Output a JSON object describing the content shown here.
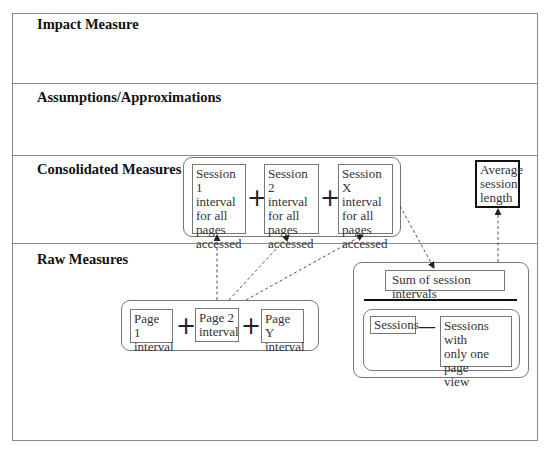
{
  "sections": [
    {
      "title": "Impact Measure"
    },
    {
      "title": "Assumptions/Approximations"
    },
    {
      "title": "Consolidated Measures"
    },
    {
      "title": "Raw Measures"
    }
  ],
  "consolidated": {
    "sessions": [
      {
        "label": "Session 1 interval for all pages accessed",
        "lines": [
          "Session 1",
          "interval",
          "for all",
          "pages",
          "accessed"
        ]
      },
      {
        "label": "Session 2 interval for all pages accessed",
        "lines": [
          "Session 2",
          "interval",
          "for all",
          "pages",
          "accessed"
        ]
      },
      {
        "label": "Session X interval for all pages accessed",
        "lines": [
          "Session X",
          "interval",
          "for all",
          "pages",
          "accessed"
        ]
      }
    ],
    "operator": "+",
    "average": {
      "lines": [
        "Average",
        "session",
        "length"
      ]
    }
  },
  "raw": {
    "pages": [
      {
        "lines": [
          "Page 1",
          "interval"
        ]
      },
      {
        "lines": [
          "Page 2",
          "interval"
        ]
      },
      {
        "lines": [
          "Page Y",
          "interval"
        ]
      }
    ],
    "operator": "+",
    "fraction": {
      "numerator": "Sum of session intervals",
      "denominator_left": "Sessions",
      "denominator_operator": "—",
      "denominator_right": {
        "lines": [
          "Sessions with",
          "only one page",
          "view"
        ]
      }
    }
  },
  "colors": {
    "line": "#888888",
    "text": "#222222",
    "arrow": "#555555"
  }
}
